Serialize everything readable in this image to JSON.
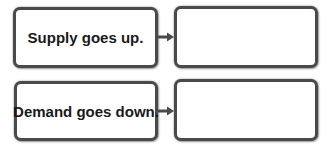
{
  "diagram": {
    "rows": [
      {
        "cause": "Supply goes up.",
        "effect": ""
      },
      {
        "cause": "Demand goes down.",
        "effect": ""
      }
    ],
    "colors": {
      "border": "#4a4a4a",
      "text": "#1a1a1a",
      "arrow": "#4a4a4a"
    }
  }
}
